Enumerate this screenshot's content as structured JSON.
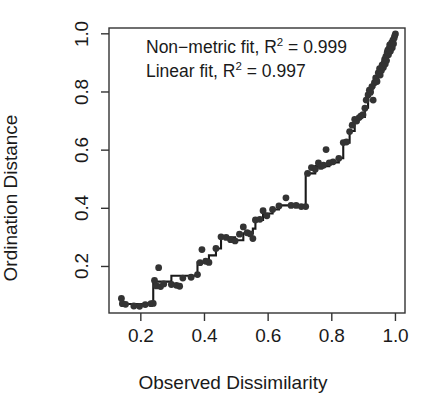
{
  "chart_data": {
    "type": "scatter",
    "title": "",
    "subtitle": "",
    "xlabel": "Observed Dissimilarity",
    "ylabel": "Ordination Distance",
    "xlim": [
      0.1,
      1.03
    ],
    "ylim": [
      0.04,
      1.02
    ],
    "xticks": [
      "0.2",
      "0.4",
      "0.6",
      "0.8",
      "1.0"
    ],
    "xtick_values": [
      0.2,
      0.4,
      0.6,
      0.8,
      1.0
    ],
    "yticks": [
      "0.2",
      "0.4",
      "0.6",
      "0.8",
      "1.0"
    ],
    "ytick_values": [
      0.2,
      0.4,
      0.6,
      0.8,
      1.0
    ],
    "grid": false,
    "legend": "none",
    "point_color": "#333333",
    "line_color": "#1a1a1a",
    "point_radius": 3.4,
    "annotations": [
      "Non-metric fit, R² = 0.999",
      "Linear fit, R² = 0.997"
    ],
    "annotation_parts": {
      "nonmetric_prefix": "Non−metric fit, R",
      "nonmetric_exponent": "2",
      "nonmetric_value": " = 0.999",
      "linear_prefix": "Linear fit, R",
      "linear_exponent": "2",
      "linear_value": " = 0.997"
    },
    "series": [
      {
        "name": "Observed vs Ordination distances",
        "type": "scatter",
        "points": [
          [
            0.139,
            0.09
          ],
          [
            0.142,
            0.072
          ],
          [
            0.152,
            0.07
          ],
          [
            0.178,
            0.064
          ],
          [
            0.196,
            0.063
          ],
          [
            0.214,
            0.069
          ],
          [
            0.232,
            0.072
          ],
          [
            0.239,
            0.073
          ],
          [
            0.243,
            0.152
          ],
          [
            0.249,
            0.133
          ],
          [
            0.256,
            0.196
          ],
          [
            0.262,
            0.131
          ],
          [
            0.272,
            0.14
          ],
          [
            0.296,
            0.138
          ],
          [
            0.312,
            0.135
          ],
          [
            0.322,
            0.132
          ],
          [
            0.332,
            0.16
          ],
          [
            0.358,
            0.163
          ],
          [
            0.378,
            0.172
          ],
          [
            0.386,
            0.213
          ],
          [
            0.392,
            0.258
          ],
          [
            0.404,
            0.218
          ],
          [
            0.414,
            0.214
          ],
          [
            0.436,
            0.262
          ],
          [
            0.452,
            0.302
          ],
          [
            0.468,
            0.3
          ],
          [
            0.482,
            0.292
          ],
          [
            0.496,
            0.288
          ],
          [
            0.51,
            0.311
          ],
          [
            0.522,
            0.336
          ],
          [
            0.534,
            0.316
          ],
          [
            0.544,
            0.312
          ],
          [
            0.552,
            0.296
          ],
          [
            0.56,
            0.36
          ],
          [
            0.574,
            0.362
          ],
          [
            0.584,
            0.392
          ],
          [
            0.596,
            0.374
          ],
          [
            0.614,
            0.396
          ],
          [
            0.634,
            0.408
          ],
          [
            0.656,
            0.436
          ],
          [
            0.672,
            0.41
          ],
          [
            0.688,
            0.41
          ],
          [
            0.704,
            0.406
          ],
          [
            0.718,
            0.406
          ],
          [
            0.724,
            0.52
          ],
          [
            0.736,
            0.54
          ],
          [
            0.748,
            0.534
          ],
          [
            0.758,
            0.556
          ],
          [
            0.766,
            0.544
          ],
          [
            0.774,
            0.548
          ],
          [
            0.782,
            0.602
          ],
          [
            0.792,
            0.556
          ],
          [
            0.804,
            0.56
          ],
          [
            0.822,
            0.572
          ],
          [
            0.836,
            0.626
          ],
          [
            0.846,
            0.628
          ],
          [
            0.856,
            0.664
          ],
          [
            0.864,
            0.686
          ],
          [
            0.872,
            0.706
          ],
          [
            0.878,
            0.7
          ],
          [
            0.886,
            0.712
          ],
          [
            0.892,
            0.718
          ],
          [
            0.898,
            0.722
          ],
          [
            0.904,
            0.744
          ],
          [
            0.908,
            0.772
          ],
          [
            0.914,
            0.79
          ],
          [
            0.918,
            0.806
          ],
          [
            0.922,
            0.8
          ],
          [
            0.926,
            0.818
          ],
          [
            0.93,
            0.772
          ],
          [
            0.934,
            0.832
          ],
          [
            0.938,
            0.848
          ],
          [
            0.942,
            0.836
          ],
          [
            0.946,
            0.866
          ],
          [
            0.95,
            0.88
          ],
          [
            0.952,
            0.858
          ],
          [
            0.956,
            0.874
          ],
          [
            0.958,
            0.892
          ],
          [
            0.962,
            0.884
          ],
          [
            0.964,
            0.9
          ],
          [
            0.966,
            0.912
          ],
          [
            0.968,
            0.896
          ],
          [
            0.97,
            0.922
          ],
          [
            0.972,
            0.908
          ],
          [
            0.974,
            0.936
          ],
          [
            0.976,
            0.944
          ],
          [
            0.978,
            0.928
          ],
          [
            0.98,
            0.95
          ],
          [
            0.982,
            0.962
          ],
          [
            0.984,
            0.94
          ],
          [
            0.986,
            0.958
          ],
          [
            0.988,
            0.97
          ],
          [
            0.99,
            0.952
          ],
          [
            0.992,
            0.978
          ],
          [
            0.994,
            0.966
          ],
          [
            0.996,
            0.986
          ],
          [
            0.998,
            0.994
          ],
          [
            1.0,
            1.0
          ]
        ]
      },
      {
        "name": "Non-metric monotone step fit",
        "type": "step",
        "points": [
          [
            0.139,
            0.071
          ],
          [
            0.239,
            0.071
          ],
          [
            0.239,
            0.152
          ],
          [
            0.243,
            0.152
          ],
          [
            0.243,
            0.148
          ],
          [
            0.296,
            0.148
          ],
          [
            0.296,
            0.168
          ],
          [
            0.378,
            0.168
          ],
          [
            0.378,
            0.214
          ],
          [
            0.414,
            0.214
          ],
          [
            0.414,
            0.238
          ],
          [
            0.436,
            0.238
          ],
          [
            0.436,
            0.262
          ],
          [
            0.452,
            0.262
          ],
          [
            0.452,
            0.3
          ],
          [
            0.496,
            0.3
          ],
          [
            0.496,
            0.29
          ],
          [
            0.522,
            0.29
          ],
          [
            0.522,
            0.314
          ],
          [
            0.552,
            0.314
          ],
          [
            0.552,
            0.33
          ],
          [
            0.56,
            0.33
          ],
          [
            0.56,
            0.36
          ],
          [
            0.584,
            0.36
          ],
          [
            0.584,
            0.382
          ],
          [
            0.614,
            0.382
          ],
          [
            0.614,
            0.396
          ],
          [
            0.634,
            0.396
          ],
          [
            0.634,
            0.41
          ],
          [
            0.718,
            0.41
          ],
          [
            0.718,
            0.52
          ],
          [
            0.748,
            0.52
          ],
          [
            0.748,
            0.545
          ],
          [
            0.792,
            0.545
          ],
          [
            0.792,
            0.558
          ],
          [
            0.822,
            0.558
          ],
          [
            0.822,
            0.572
          ],
          [
            0.836,
            0.572
          ],
          [
            0.836,
            0.626
          ],
          [
            0.856,
            0.626
          ],
          [
            0.856,
            0.666
          ],
          [
            0.872,
            0.666
          ],
          [
            0.872,
            0.706
          ],
          [
            0.886,
            0.706
          ],
          [
            0.886,
            0.714
          ],
          [
            0.904,
            0.714
          ],
          [
            0.904,
            0.746
          ],
          [
            0.914,
            0.746
          ],
          [
            0.914,
            0.792
          ],
          [
            0.926,
            0.792
          ],
          [
            0.926,
            0.818
          ],
          [
            0.934,
            0.818
          ],
          [
            0.934,
            0.834
          ],
          [
            0.946,
            0.834
          ],
          [
            0.946,
            0.866
          ],
          [
            0.956,
            0.866
          ],
          [
            0.956,
            0.88
          ],
          [
            0.964,
            0.88
          ],
          [
            0.964,
            0.902
          ],
          [
            0.972,
            0.902
          ],
          [
            0.972,
            0.926
          ],
          [
            0.98,
            0.926
          ],
          [
            0.98,
            0.95
          ],
          [
            0.988,
            0.95
          ],
          [
            0.988,
            0.968
          ],
          [
            0.994,
            0.968
          ],
          [
            0.994,
            0.984
          ],
          [
            1.0,
            0.984
          ],
          [
            1.0,
            1.0
          ]
        ]
      }
    ]
  }
}
